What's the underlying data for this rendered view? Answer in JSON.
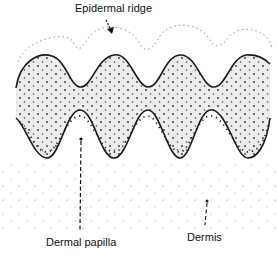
{
  "labels": {
    "epidermal_ridge": "Epidermal ridge",
    "dermal_papilla": "Dermal papilla",
    "dermis": "Dermis"
  },
  "colors": {
    "outline": "#1a1a1a",
    "epidermis_fill": "#ececec",
    "stipple": "#333333",
    "background": "#ffffff"
  },
  "structure": {
    "upper_boundary_peaks_x": [
      48,
      114,
      180,
      245
    ],
    "upper_boundary_troughs_x": [
      80,
      148,
      213
    ],
    "lower_boundary_arches_x": [
      80,
      148,
      213
    ],
    "dermal_papillae_x": [
      47,
      114,
      180,
      248
    ]
  }
}
